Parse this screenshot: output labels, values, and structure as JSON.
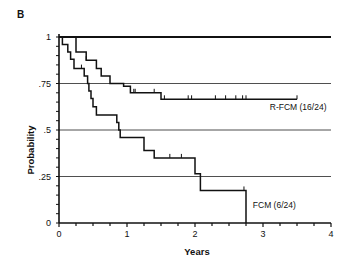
{
  "panel_label": "B",
  "chart_data": {
    "type": "line",
    "subtype": "kaplan-meier step",
    "title": "",
    "xlabel": "Years",
    "ylabel": "Probability",
    "xlim": [
      0,
      4
    ],
    "ylim": [
      0,
      1
    ],
    "x_ticks": [
      "0",
      "1",
      "2",
      "3",
      "4"
    ],
    "y_ticks": [
      "0",
      ".25",
      ".5",
      ".75",
      "1"
    ],
    "grid": "horizontal at .25, .5, .75, 1",
    "series": [
      {
        "name": "R-FCM (16/24)",
        "steps": [
          [
            0,
            1
          ],
          [
            0.25,
            1
          ],
          [
            0.25,
            0.92
          ],
          [
            0.4,
            0.92
          ],
          [
            0.4,
            0.875
          ],
          [
            0.55,
            0.875
          ],
          [
            0.55,
            0.83
          ],
          [
            0.62,
            0.83
          ],
          [
            0.62,
            0.79
          ],
          [
            0.75,
            0.79
          ],
          [
            0.75,
            0.75
          ],
          [
            0.95,
            0.75
          ],
          [
            0.95,
            0.735
          ],
          [
            1.05,
            0.735
          ],
          [
            1.05,
            0.7
          ],
          [
            1.5,
            0.7
          ],
          [
            1.5,
            0.665
          ],
          [
            3.5,
            0.665
          ]
        ],
        "censored_x": [
          0.4,
          1.1,
          1.12,
          1.4,
          1.55,
          1.9,
          1.95,
          2.3,
          2.45,
          2.6,
          2.7,
          2.75,
          3.5
        ]
      },
      {
        "name": "FCM (6/24)",
        "steps": [
          [
            0,
            1
          ],
          [
            0.05,
            1
          ],
          [
            0.05,
            0.96
          ],
          [
            0.13,
            0.96
          ],
          [
            0.13,
            0.92
          ],
          [
            0.17,
            0.92
          ],
          [
            0.17,
            0.88
          ],
          [
            0.22,
            0.88
          ],
          [
            0.22,
            0.83
          ],
          [
            0.37,
            0.83
          ],
          [
            0.37,
            0.79
          ],
          [
            0.42,
            0.79
          ],
          [
            0.42,
            0.75
          ],
          [
            0.44,
            0.75
          ],
          [
            0.44,
            0.71
          ],
          [
            0.47,
            0.71
          ],
          [
            0.47,
            0.67
          ],
          [
            0.5,
            0.67
          ],
          [
            0.5,
            0.625
          ],
          [
            0.55,
            0.625
          ],
          [
            0.55,
            0.58
          ],
          [
            0.85,
            0.58
          ],
          [
            0.85,
            0.54
          ],
          [
            0.88,
            0.54
          ],
          [
            0.88,
            0.5
          ],
          [
            0.9,
            0.5
          ],
          [
            0.9,
            0.46
          ],
          [
            1.25,
            0.46
          ],
          [
            1.25,
            0.39
          ],
          [
            1.4,
            0.39
          ],
          [
            1.4,
            0.35
          ],
          [
            2.0,
            0.35
          ],
          [
            2.0,
            0.265
          ],
          [
            2.08,
            0.265
          ],
          [
            2.08,
            0.175
          ],
          [
            2.75,
            0.175
          ],
          [
            2.75,
            0
          ]
        ],
        "censored_x": [
          0.33,
          1.63,
          1.8,
          2.72
        ]
      },
      {
        "name": "reference (1.0)",
        "steps": [
          [
            0,
            1
          ],
          [
            4,
            1
          ]
        ]
      }
    ],
    "annotations": [
      {
        "text": "R-FCM (16/24)",
        "x": 3.1,
        "y": 0.61
      },
      {
        "text": "FCM (6/24)",
        "x": 2.85,
        "y": 0.08
      }
    ]
  }
}
